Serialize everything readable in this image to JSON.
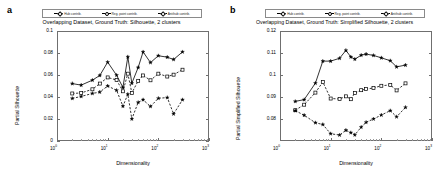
{
  "figure": {
    "panels": [
      {
        "letter": "a",
        "title": "Overlapping Dataset, Ground Truth: Silhouette, 2 clusters",
        "ylabel": "Partial Silhouette",
        "xlabel": "Dimensionality"
      },
      {
        "letter": "b",
        "title": "Overlapping Dataset, Ground Truth: Simplified Silhouette, 2 clusters",
        "ylabel": "Partial Simplified Silhouette",
        "xlabel": "Dimensionality"
      }
    ],
    "legend": {
      "position": "top-center",
      "entries": [
        {
          "label": "Hub contrib.",
          "marker": "star",
          "line": "solid",
          "color": "#000000"
        },
        {
          "label": "Reg. point contrib.",
          "marker": "square",
          "line": "dashed",
          "color": "#000000"
        },
        {
          "label": "Antihub contrib.",
          "marker": "star",
          "line": "dashed",
          "color": "#000000"
        }
      ]
    }
  },
  "chart_data": [
    {
      "type": "line",
      "title": "Overlapping Dataset, Ground Truth: Silhouette, 2 clusters",
      "xlabel": "Dimensionality",
      "ylabel": "Partial Silhouette",
      "xscale": "log",
      "xlim": [
        1,
        1000
      ],
      "ylim": [
        0,
        0.1
      ],
      "yticks": [
        0,
        0.02,
        0.04,
        0.06,
        0.08,
        0.1
      ],
      "ytick_labels": [
        "0",
        "0.02",
        "0.04",
        "0.06",
        "0.08",
        "0.1"
      ],
      "xticks": [
        1,
        10,
        100,
        1000
      ],
      "xtick_labels": [
        "10^0",
        "10^1",
        "10^2",
        "10^3"
      ],
      "grid": false,
      "legend": "top-center",
      "x": [
        2,
        3,
        5,
        7,
        10,
        15,
        20,
        25,
        30,
        40,
        50,
        70,
        100,
        150,
        200,
        300
      ],
      "series": [
        {
          "name": "Hub contrib.",
          "line": "solid",
          "marker": "star",
          "values": [
            0.0522,
            0.0508,
            0.0553,
            0.0596,
            0.0717,
            0.0598,
            0.0487,
            0.0765,
            0.0525,
            0.0668,
            0.081,
            0.0713,
            0.0775,
            0.0762,
            0.0741,
            0.081
          ]
        },
        {
          "name": "Reg. point contrib.",
          "line": "dashed",
          "marker": "square",
          "values": [
            0.0432,
            0.0437,
            0.047,
            0.0522,
            0.0578,
            0.0554,
            0.0452,
            0.0612,
            0.0437,
            0.0547,
            0.0596,
            0.0552,
            0.0612,
            0.0586,
            0.0603,
            0.0648
          ]
        },
        {
          "name": "Antihub contrib.",
          "line": "dashed",
          "marker": "star",
          "values": [
            0.0387,
            0.0405,
            0.0432,
            0.0445,
            0.05,
            0.0461,
            0.0316,
            0.0425,
            0.02,
            0.0351,
            0.0375,
            0.0314,
            0.0388,
            0.0395,
            0.0246,
            0.0375
          ]
        }
      ]
    },
    {
      "type": "line",
      "title": "Overlapping Dataset, Ground Truth: Simplified Silhouette, 2 clusters",
      "xlabel": "Dimensionality",
      "ylabel": "Partial Simplified Silhouette",
      "xscale": "log",
      "xlim": [
        1,
        1000
      ],
      "ylim": [
        0.07,
        0.12
      ],
      "yticks": [
        0.08,
        0.09,
        0.1,
        0.11,
        0.12
      ],
      "ytick_labels": [
        "0.08",
        "0.09",
        "0.1",
        "0.11",
        "0.12"
      ],
      "xticks": [
        1,
        10,
        100,
        1000
      ],
      "xtick_labels": [
        "10^0",
        "10^1",
        "10^2",
        "10^3"
      ],
      "grid": false,
      "legend": "top-center",
      "x": [
        2,
        3,
        5,
        7,
        10,
        15,
        20,
        25,
        30,
        40,
        50,
        70,
        100,
        150,
        200,
        300
      ],
      "series": [
        {
          "name": "Hub contrib.",
          "line": "solid",
          "marker": "star",
          "values": [
            0.088,
            0.0888,
            0.0963,
            0.1063,
            0.1063,
            0.1076,
            0.1112,
            0.1082,
            0.1072,
            0.109,
            0.1095,
            0.1089,
            0.1078,
            0.1065,
            0.1037,
            0.1045
          ]
        },
        {
          "name": "Reg. point contrib.",
          "line": "dashed",
          "marker": "square",
          "values": [
            0.084,
            0.0865,
            0.092,
            0.0968,
            0.0893,
            0.0891,
            0.0903,
            0.089,
            0.0918,
            0.0931,
            0.0936,
            0.0941,
            0.0951,
            0.0955,
            0.093,
            0.0962
          ]
        },
        {
          "name": "Antihub contrib.",
          "line": "dashed",
          "marker": "star",
          "values": [
            0.0838,
            0.0817,
            0.0783,
            0.0775,
            0.0733,
            0.0727,
            0.0749,
            0.0738,
            0.0728,
            0.0763,
            0.0785,
            0.08,
            0.0818,
            0.0838,
            0.081,
            0.0853
          ]
        }
      ]
    }
  ]
}
